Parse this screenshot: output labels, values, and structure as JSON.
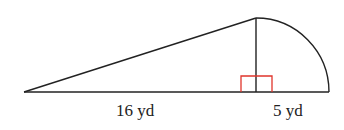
{
  "diagram": {
    "type": "geometry",
    "labels": {
      "left_segment": "16 yd",
      "right_segment": "5 yd"
    },
    "colors": {
      "stroke": "#222222",
      "right_angle_marker": "#e0352b",
      "background": "#ffffff"
    },
    "shapes": {
      "triangle": {
        "left_vertex": [
          24,
          92
        ],
        "apex": [
          256,
          18
        ],
        "foot": [
          256,
          92
        ]
      },
      "quarter_circle": {
        "center": [
          256,
          92
        ],
        "radius_x": 73,
        "radius_y": 74
      },
      "baseline": {
        "from": [
          24,
          92
        ],
        "to": [
          329,
          92
        ]
      },
      "right_angle_marker": {
        "x": 241,
        "y": 76,
        "width": 31,
        "height": 16
      }
    }
  }
}
